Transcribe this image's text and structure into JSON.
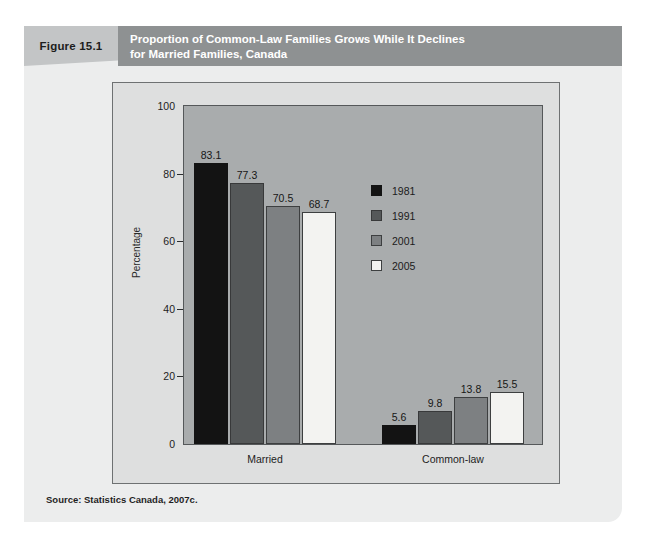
{
  "figure": {
    "number_label": "Figure 15.1",
    "title_line1": "Proportion of Common-Law Families Grows While It Declines",
    "title_line2": "for Married Families, Canada",
    "source": "Source: Statistics Canada, 2007c.",
    "header_bg": "#8e9192",
    "number_bg": "#c3c5c6",
    "card_bg": "#eceded"
  },
  "chart_data": {
    "type": "bar",
    "title": "Proportion of Common-Law Families Grows While It Declines for Married Families, Canada",
    "subtitle": "",
    "xlabel": "",
    "ylabel": "Percentage",
    "categories": [
      "Married",
      "Common-law"
    ],
    "series": [
      {
        "name": "1981",
        "color": "#131313",
        "values": [
          83.1,
          5.6
        ]
      },
      {
        "name": "1991",
        "color": "#555859",
        "values": [
          77.3,
          9.8
        ]
      },
      {
        "name": "2001",
        "color": "#7d8082",
        "values": [
          70.5,
          13.8
        ]
      },
      {
        "name": "2005",
        "color": "#f3f3f1",
        "values": [
          68.7,
          15.5
        ]
      }
    ],
    "ylim": [
      0,
      100
    ],
    "yticks": [
      "0",
      "20",
      "40",
      "60",
      "80",
      "100"
    ],
    "grid": false,
    "legend_position": "inside-right",
    "plot_bg": "#a9acad",
    "frame_bg": "#dedfdf",
    "data_labels": {
      "Married": [
        "83.1",
        "77.3",
        "70.5",
        "68.7"
      ],
      "Common-law": [
        "5.6",
        "9.8",
        "13.8",
        "15.5"
      ]
    }
  }
}
